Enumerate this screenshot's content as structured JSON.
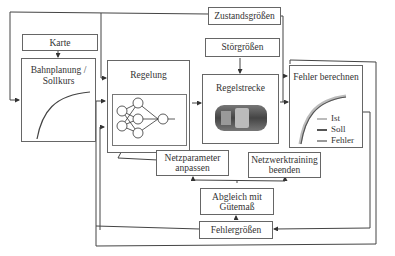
{
  "diagram": {
    "title": "",
    "nodes": {
      "zustand": "Zustandsgrößen",
      "karte": "Karte",
      "stoer": "Störgrößen",
      "bahn_l1": "Bahnplanung /",
      "bahn_l2": "Sollkurs",
      "regelung": "Regelung",
      "regelstrecke": "Regelstrecke",
      "fehler": "Fehler berechnen",
      "netzparam_l1": "Netzparameter",
      "netzparam_l2": "anpassen",
      "netztrain_l1": "Netzwerktraining",
      "netztrain_l2": "beenden",
      "abgleich_l1": "Abgleich mit",
      "abgleich_l2": "Gütemaß",
      "fehlergroessen": "Fehlergrößen"
    },
    "legend": {
      "ist": "Ist",
      "soll": "Soll",
      "fehler": "Fehler"
    },
    "colors": {
      "ist": "#bbbbbb",
      "soll": "#555555",
      "fehler": "#999999",
      "line": "#444444"
    }
  }
}
